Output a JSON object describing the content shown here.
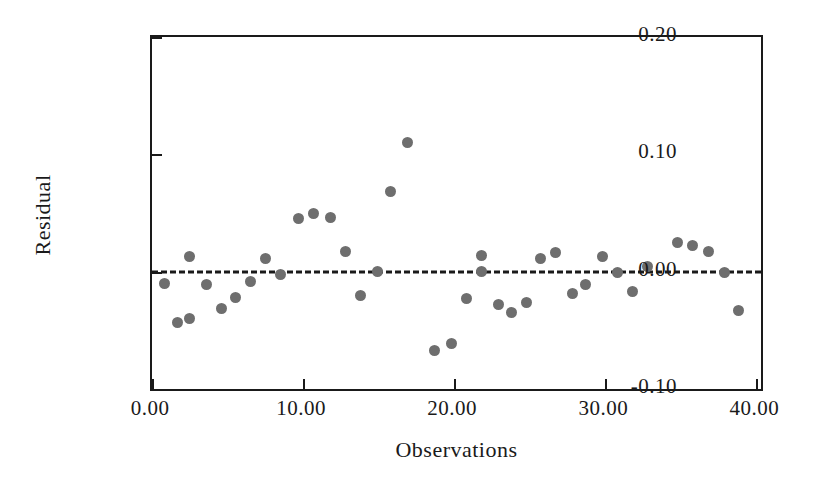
{
  "chart_data": {
    "type": "scatter",
    "title": "",
    "xlabel": "Observations",
    "ylabel": "Residual",
    "xlim": [
      0,
      40.3
    ],
    "ylim": [
      -0.1,
      0.2
    ],
    "grid": false,
    "legend": null,
    "xticks": [
      "0.00",
      "10.00",
      "20.00",
      "30.00",
      "40.00"
    ],
    "xtick_values": [
      0,
      10,
      20,
      30,
      40
    ],
    "yticks": [
      "0.20",
      "0.10",
      "0.00",
      "-0.10"
    ],
    "ytick_values": [
      0.2,
      0.1,
      0.0,
      -0.1
    ],
    "reference_line": {
      "name": "zero-line",
      "y": 0.0,
      "style": "dashed",
      "color": "#1a1a1a"
    },
    "marker": {
      "shape": "circle",
      "color": "#6e6e6e",
      "size": 11
    },
    "x": [
      0.8,
      1.7,
      2.5,
      3.4,
      4.4,
      5.3,
      6.2,
      7.1,
      8.0,
      8.9,
      9.7,
      10.6,
      11.5,
      12.7,
      13.8,
      14.8,
      15.8,
      16.9,
      18.2,
      19.3,
      20.3,
      21.2,
      22.2,
      23.0,
      23.9,
      24.8,
      25.6,
      26.5,
      27.3,
      28.2,
      29.0,
      29.9,
      30.8,
      31.7,
      32.6,
      33.5,
      34.8,
      35.7,
      36.6,
      37.8,
      38.7
    ],
    "y": [
      -0.01,
      -0.043,
      -0.04,
      0.013,
      -0.014,
      -0.031,
      -0.022,
      -0.008,
      0.011,
      -0.002,
      0.045,
      0.05,
      0.047,
      0.017,
      -0.02,
      0.0,
      0.068,
      0.11,
      -0.067,
      -0.061,
      -0.023,
      0.014,
      0.0,
      -0.027,
      -0.033,
      -0.025,
      0.011,
      0.016,
      -0.019,
      -0.011,
      0.013,
      -0.001,
      0.0,
      -0.017,
      0.004,
      0.025,
      0.022,
      0.017,
      -0.001,
      -0.033,
      -0.033
    ],
    "points": [
      {
        "x": 0.8,
        "y": -0.01
      },
      {
        "x": 1.7,
        "y": -0.043
      },
      {
        "x": 2.5,
        "y": -0.04
      },
      {
        "x": 2.5,
        "y": 0.013
      },
      {
        "x": 3.6,
        "y": -0.011
      },
      {
        "x": 4.6,
        "y": -0.031
      },
      {
        "x": 5.5,
        "y": -0.022
      },
      {
        "x": 6.5,
        "y": -0.008
      },
      {
        "x": 7.5,
        "y": 0.011
      },
      {
        "x": 8.5,
        "y": -0.002
      },
      {
        "x": 9.7,
        "y": 0.045
      },
      {
        "x": 10.7,
        "y": 0.05
      },
      {
        "x": 11.8,
        "y": 0.046
      },
      {
        "x": 12.8,
        "y": 0.017
      },
      {
        "x": 13.8,
        "y": -0.02
      },
      {
        "x": 14.9,
        "y": 0.0
      },
      {
        "x": 15.8,
        "y": 0.068
      },
      {
        "x": 16.9,
        "y": 0.11
      },
      {
        "x": 18.7,
        "y": -0.067
      },
      {
        "x": 19.8,
        "y": -0.061
      },
      {
        "x": 20.8,
        "y": -0.023
      },
      {
        "x": 21.8,
        "y": 0.014
      },
      {
        "x": 21.8,
        "y": 0.0
      },
      {
        "x": 22.9,
        "y": -0.028
      },
      {
        "x": 23.8,
        "y": -0.035
      },
      {
        "x": 24.8,
        "y": -0.026
      },
      {
        "x": 25.7,
        "y": 0.011
      },
      {
        "x": 26.7,
        "y": 0.016
      },
      {
        "x": 27.8,
        "y": -0.019
      },
      {
        "x": 28.7,
        "y": -0.011
      },
      {
        "x": 29.8,
        "y": 0.013
      },
      {
        "x": 30.8,
        "y": -0.001
      },
      {
        "x": 31.8,
        "y": -0.017
      },
      {
        "x": 32.8,
        "y": 0.004
      },
      {
        "x": 34.8,
        "y": 0.025
      },
      {
        "x": 35.8,
        "y": 0.022
      },
      {
        "x": 36.8,
        "y": 0.017
      },
      {
        "x": 37.9,
        "y": -0.001
      },
      {
        "x": 38.8,
        "y": -0.033
      }
    ]
  },
  "axis": {
    "frame_color": "#1a1a1a"
  }
}
